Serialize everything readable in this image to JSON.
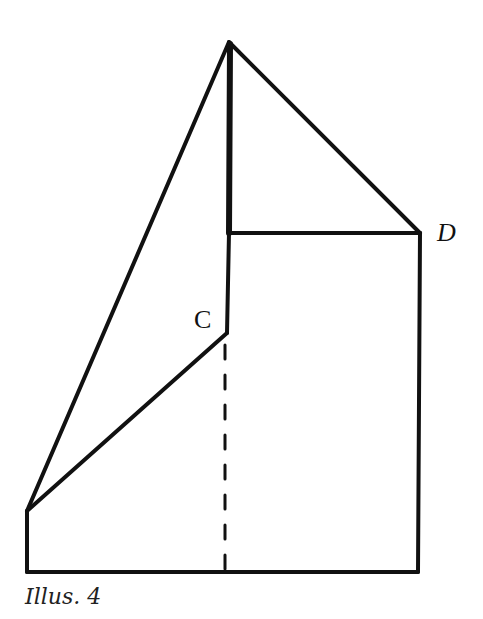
{
  "figure": {
    "caption": "Illus. 4",
    "labels": {
      "c": "C",
      "d": "D"
    },
    "colors": {
      "line": "#111111",
      "background": "#ffffff"
    }
  },
  "geometry": {
    "apex": [
      229,
      42
    ],
    "inner_corner": [
      229,
      233
    ],
    "c": [
      227,
      333
    ],
    "d": [
      420,
      233
    ],
    "left_top": [
      27,
      511
    ],
    "left_bottom": [
      27,
      572
    ],
    "right_bottom": [
      418,
      572
    ],
    "dashed_bottom": [
      225,
      570
    ]
  }
}
